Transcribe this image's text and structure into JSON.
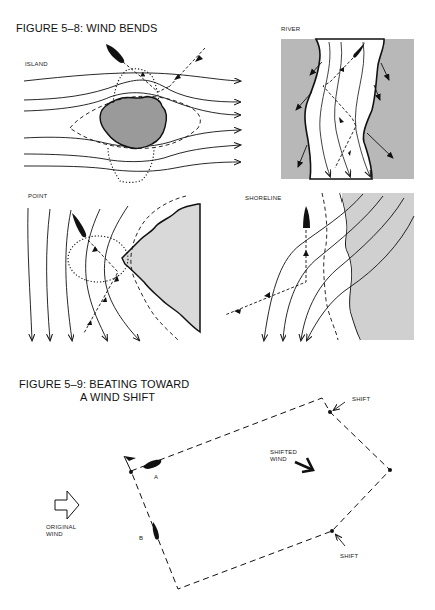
{
  "figure_5_8": {
    "title": "FIGURE 5–8: WIND BENDS",
    "panels": {
      "island": {
        "label": "ISLAND"
      },
      "river": {
        "label": "RIVER"
      },
      "point": {
        "label": "POINT"
      },
      "shoreline": {
        "label": "SHORELINE"
      }
    }
  },
  "figure_5_9": {
    "title_line1": "FIGURE 5–9: BEATING TOWARD",
    "title_line2": "A WIND SHIFT",
    "labels": {
      "original_wind": [
        "ORIGINAL",
        "WIND"
      ],
      "shifted_wind": [
        "SHIFTED",
        "WIND"
      ],
      "shift_top": "SHIFT",
      "shift_bottom": "SHIFT",
      "boat_a": "A",
      "boat_b": "B"
    }
  },
  "colors": {
    "ink": "#111111",
    "land_dark": "#9a9a9a",
    "land_light": "#d9d9d9",
    "background": "#ffffff"
  }
}
